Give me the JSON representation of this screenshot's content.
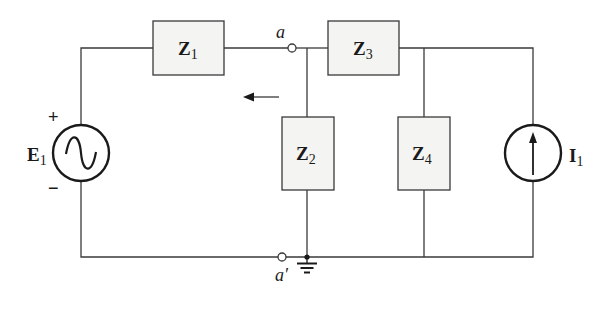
{
  "diagram": {
    "type": "circuit-schematic",
    "components": {
      "E1": {
        "symbol": "E",
        "subscript": "1",
        "kind": "ac-voltage-source",
        "plus": "+",
        "minus": "−"
      },
      "Z1": {
        "symbol": "Z",
        "subscript": "1",
        "kind": "impedance"
      },
      "Z2": {
        "symbol": "Z",
        "subscript": "2",
        "kind": "impedance"
      },
      "Z3": {
        "symbol": "Z",
        "subscript": "3",
        "kind": "impedance"
      },
      "Z4": {
        "symbol": "Z",
        "subscript": "4",
        "kind": "impedance"
      },
      "I1": {
        "symbol": "I",
        "subscript": "1",
        "kind": "current-source",
        "direction": "up"
      }
    },
    "nodes": {
      "a": {
        "label": "a"
      },
      "a_prime": {
        "label": "a′"
      }
    },
    "annotations": {
      "arrow_direction": "left"
    },
    "colors": {
      "line": "#3a3a3a",
      "box_fill": "#f4f4f2",
      "background": "#ffffff"
    }
  }
}
